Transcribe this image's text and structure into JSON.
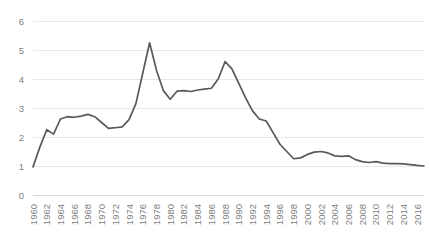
{
  "chart_data": {
    "type": "line",
    "title": "",
    "subtitle": "",
    "xlabel": "",
    "ylabel": "",
    "legend": [],
    "legend_position": "none",
    "grid": "horizontal",
    "xlim": [
      1960,
      2017
    ],
    "ylim": [
      0,
      6
    ],
    "ytick_values": [
      0,
      1,
      2,
      3,
      4,
      5,
      6
    ],
    "ytick_labels": [
      "0",
      "1",
      "2",
      "3",
      "4",
      "5",
      "6"
    ],
    "xtick_labels": [
      "1960",
      "1962",
      "1964",
      "1966",
      "1968",
      "1970",
      "1972",
      "1974",
      "1976",
      "1978",
      "1980",
      "1982",
      "1984",
      "1986",
      "1988",
      "1990",
      "1992",
      "1994",
      "1996",
      "1998",
      "2000",
      "2002",
      "2004",
      "2006",
      "2008",
      "2010",
      "2012",
      "2014",
      "2016"
    ],
    "xtick_step": 2,
    "x": [
      1960,
      1961,
      1962,
      1963,
      1964,
      1965,
      1966,
      1967,
      1968,
      1969,
      1970,
      1971,
      1972,
      1973,
      1974,
      1975,
      1976,
      1977,
      1978,
      1979,
      1980,
      1981,
      1982,
      1983,
      1984,
      1985,
      1986,
      1987,
      1988,
      1989,
      1990,
      1991,
      1992,
      1993,
      1994,
      1995,
      1996,
      1997,
      1998,
      1999,
      2000,
      2001,
      2002,
      2003,
      2004,
      2005,
      2006,
      2007,
      2008,
      2009,
      2010,
      2011,
      2012,
      2013,
      2014,
      2015,
      2016,
      2017
    ],
    "values": [
      0.97,
      1.65,
      2.25,
      2.1,
      2.62,
      2.7,
      2.68,
      2.72,
      2.78,
      2.7,
      2.5,
      2.3,
      2.32,
      2.35,
      2.6,
      3.15,
      4.2,
      5.25,
      4.3,
      3.6,
      3.3,
      3.58,
      3.6,
      3.57,
      3.62,
      3.65,
      3.68,
      4.0,
      4.6,
      4.35,
      3.85,
      3.35,
      2.9,
      2.62,
      2.55,
      2.15,
      1.75,
      1.5,
      1.25,
      1.28,
      1.4,
      1.48,
      1.5,
      1.45,
      1.35,
      1.33,
      1.35,
      1.22,
      1.15,
      1.12,
      1.15,
      1.1,
      1.08,
      1.08,
      1.07,
      1.05,
      1.02,
      1.0
    ],
    "line_color": "#595959",
    "gridline_color": "#e8e8e8",
    "background_color": "#ffffff",
    "tick_label_color": "#808080",
    "peaks": [
      {
        "x": 1977,
        "y": 5.25
      },
      {
        "x": 1988,
        "y": 4.6
      }
    ]
  }
}
